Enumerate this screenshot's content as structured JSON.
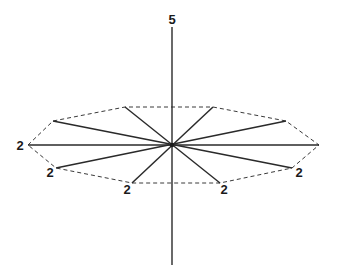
{
  "diagram": {
    "type": "symmetry-element-diagram",
    "colors": {
      "line": "#2a2a2a",
      "dashed": "#3a3a3a",
      "text": "#1a1a1a",
      "background": "#ffffff"
    },
    "center": {
      "x": 172,
      "y": 145
    },
    "principal_axis": {
      "label": "5",
      "order": 5,
      "top": {
        "x": 172,
        "y": 27
      },
      "bottom": {
        "x": 172,
        "y": 265
      },
      "label_pos": {
        "x": 172,
        "y": 24
      }
    },
    "polygon_vertices": [
      {
        "x": 28,
        "y": 145
      },
      {
        "x": 53,
        "y": 121
      },
      {
        "x": 125,
        "y": 107
      },
      {
        "x": 213,
        "y": 107
      },
      {
        "x": 286,
        "y": 121
      },
      {
        "x": 319,
        "y": 145
      },
      {
        "x": 292,
        "y": 168
      },
      {
        "x": 220,
        "y": 183
      },
      {
        "x": 132,
        "y": 183
      },
      {
        "x": 56,
        "y": 168
      }
    ],
    "twofold_axes": [
      {
        "label": "2",
        "end": {
          "x": 28,
          "y": 145
        },
        "opposite": {
          "x": 319,
          "y": 145
        },
        "label_pos": {
          "x": 20,
          "y": 150
        }
      },
      {
        "label": "2",
        "end": {
          "x": 56,
          "y": 168
        },
        "opposite": {
          "x": 286,
          "y": 121
        },
        "label_pos": {
          "x": 50,
          "y": 177
        }
      },
      {
        "label": "2",
        "end": {
          "x": 132,
          "y": 183
        },
        "opposite": {
          "x": 213,
          "y": 107
        },
        "label_pos": {
          "x": 127,
          "y": 194
        }
      },
      {
        "label": "2",
        "end": {
          "x": 220,
          "y": 183
        },
        "opposite": {
          "x": 125,
          "y": 107
        },
        "label_pos": {
          "x": 224,
          "y": 194
        }
      },
      {
        "label": "2",
        "end": {
          "x": 292,
          "y": 168
        },
        "opposite": {
          "x": 53,
          "y": 121
        },
        "label_pos": {
          "x": 299,
          "y": 177
        }
      }
    ],
    "labels": {
      "principal": "5",
      "twofold": [
        "2",
        "2",
        "2",
        "2",
        "2"
      ]
    }
  }
}
